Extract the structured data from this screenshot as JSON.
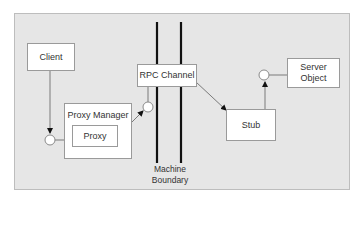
{
  "diagram": {
    "nodes": {
      "client": "Client",
      "proxy_manager": "Proxy Manager",
      "proxy": "Proxy",
      "rpc_channel": "RPC Channel",
      "stub": "Stub",
      "server_object_line1": "Server",
      "server_object_line2": "Object"
    },
    "boundary_label_line1": "Machine",
    "boundary_label_line2": "Boundary",
    "edges": [
      {
        "from": "Client",
        "to": "Proxy interface",
        "arrow": true
      },
      {
        "from": "Proxy",
        "to": "RPC Channel interface",
        "arrow": true
      },
      {
        "from": "RPC Channel",
        "to": "Stub",
        "arrow": true
      },
      {
        "from": "Stub",
        "to": "Server Object interface",
        "arrow": true
      }
    ],
    "colors": {
      "frame_bg": "#e6e6e6",
      "box_bg": "#ffffff",
      "line": "#7a7a7a",
      "boundary": "#111111"
    }
  }
}
